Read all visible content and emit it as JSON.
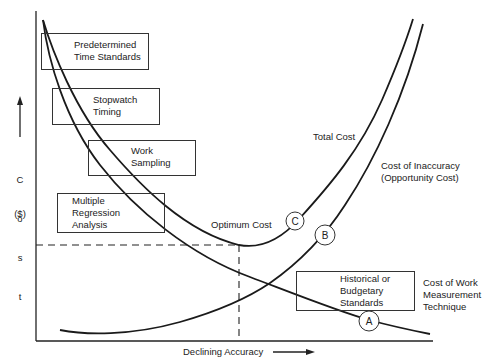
{
  "diagram": {
    "type": "cost-accuracy tradeoff curves",
    "y_axis": {
      "arrow": "up-arrow",
      "label_letters": [
        "C",
        "o",
        "s",
        "t"
      ],
      "unit": "($)"
    },
    "x_axis": {
      "label": "Declining Accuracy",
      "arrow": "right-arrow"
    },
    "boxes": [
      {
        "id": "predetermined",
        "lines": "Predetermined\nTime Standards"
      },
      {
        "id": "stopwatch",
        "lines": "Stopwatch\nTiming"
      },
      {
        "id": "work-sampling",
        "lines": "Work\nSampling"
      },
      {
        "id": "multiple-regression",
        "lines": "Multiple\nRegression\nAnalysis"
      },
      {
        "id": "historical",
        "lines": "Historical or\nBudgetary\nStandards"
      }
    ],
    "curve_labels": {
      "total_cost": "Total Cost",
      "inaccuracy": "Cost of Inaccuracy\n(Opportunity Cost)",
      "work_measurement": "Cost of Work\nMeasurement\nTechnique",
      "optimum": "Optimum Cost"
    },
    "markers": {
      "a": "A",
      "b": "B",
      "c": "C"
    },
    "colors": {
      "line": "#1a1a1a",
      "background": "#ffffff"
    }
  }
}
